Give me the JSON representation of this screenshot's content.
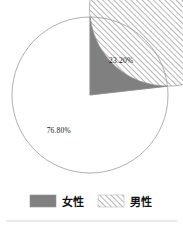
{
  "chart_data": {
    "type": "pie",
    "title": "",
    "categories": [
      "女性",
      "男性"
    ],
    "values": [
      23.2,
      76.8
    ],
    "value_labels": [
      "23.20%",
      "76.80%"
    ],
    "units": "percent",
    "start_angle_deg": 90,
    "direction": "counterclockwise",
    "legend_position": "bottom",
    "grid": false,
    "slices": [
      {
        "label": "女性",
        "value": 23.2,
        "value_label": "23.20%",
        "fill_style": "solid",
        "color": "#808080"
      },
      {
        "label": "男性",
        "value": 76.8,
        "value_label": "76.80%",
        "fill_style": "diagonal-hatch",
        "color": "#b4b4b4"
      }
    ]
  },
  "legend": {
    "items": [
      {
        "label": "女性",
        "swatch": "solid",
        "color": "#808080"
      },
      {
        "label": "男性",
        "swatch": "diagonal-hatch",
        "color": "#b4b4b4"
      }
    ]
  },
  "colors": {
    "female_fill": "#808080",
    "male_hatch": "#b4b4b4",
    "background": "#ffffff",
    "text": "#1a1a1a",
    "outline": "#999999",
    "divider": "#cfcfcf"
  }
}
